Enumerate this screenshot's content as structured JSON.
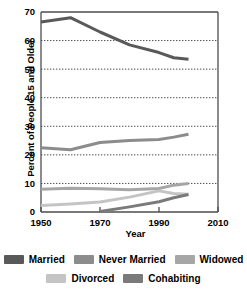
{
  "chart_data": {
    "type": "line",
    "title": "",
    "xlabel": "Year",
    "ylabel": "Percent of People 15 and Older",
    "xlim": [
      1950,
      2010
    ],
    "ylim": [
      0,
      70
    ],
    "xticks": [
      1950,
      1970,
      1990,
      2010
    ],
    "yticks": [
      0,
      10,
      20,
      30,
      40,
      50,
      60,
      70
    ],
    "grid": "horizontal-dotted",
    "legend_position": "bottom",
    "series": [
      {
        "name": "Married",
        "color": "#595959",
        "x": [
          1950,
          1960,
          1970,
          1980,
          1990,
          1995,
          2000
        ],
        "values": [
          66.5,
          68.0,
          63.0,
          58.5,
          55.8,
          54.0,
          53.5
        ]
      },
      {
        "name": "Never Married",
        "color": "#8c8c8c",
        "x": [
          1950,
          1960,
          1970,
          1980,
          1990,
          1995,
          2000
        ],
        "values": [
          22.5,
          21.8,
          24.3,
          25.0,
          25.4,
          26.2,
          27.2
        ]
      },
      {
        "name": "Widowed",
        "color": "#a6a6a6",
        "x": [
          1950,
          1960,
          1970,
          1980,
          1990,
          1995,
          2000
        ],
        "values": [
          8.0,
          8.3,
          8.1,
          7.8,
          8.2,
          9.4,
          10.0
        ]
      },
      {
        "name": "Divorced",
        "color": "#c4c4c4",
        "x": [
          1950,
          1960,
          1970,
          1980,
          1990,
          1995,
          2000
        ],
        "values": [
          2.3,
          2.8,
          3.5,
          5.2,
          7.4,
          6.5,
          6.2
        ]
      },
      {
        "name": "Cohabiting",
        "color": "#7a7a7a",
        "x": [
          1970,
          1980,
          1990,
          1995,
          2000
        ],
        "values": [
          0.2,
          1.8,
          3.6,
          5.0,
          6.1
        ]
      }
    ]
  },
  "axes": {
    "ylabel": "Percent of People 15 and Older",
    "xlabel": "Year",
    "xticklabels": [
      "1950",
      "1970",
      "1990",
      "2010"
    ],
    "yticklabels": [
      "0",
      "10",
      "20",
      "30",
      "40",
      "50",
      "60",
      "70"
    ]
  },
  "legend": {
    "row1": [
      {
        "label": "Married",
        "color": "#595959"
      },
      {
        "label": "Never Married",
        "color": "#8c8c8c"
      },
      {
        "label": "Widowed",
        "color": "#a6a6a6"
      }
    ],
    "row2": [
      {
        "label": "Divorced",
        "color": "#c4c4c4"
      },
      {
        "label": "Cohabiting",
        "color": "#7a7a7a"
      }
    ]
  },
  "style": {
    "axis_color": "#4d4d4d",
    "grid_color": "#4d4d4d",
    "background": "#ffffff"
  }
}
